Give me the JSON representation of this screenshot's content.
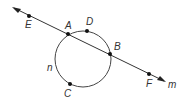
{
  "diagram": {
    "line_label": "m",
    "circle_label": "n",
    "points": {
      "E": "E",
      "A": "A",
      "D": "D",
      "B": "B",
      "C": "C",
      "F": "F"
    }
  }
}
